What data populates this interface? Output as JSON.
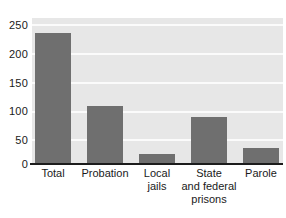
{
  "chart_data": {
    "type": "bar",
    "title": "",
    "subtitle": "",
    "xlabel": "",
    "ylabel": "",
    "categories": [
      "Total",
      "Probation",
      "Local jails",
      "State and federal prisons",
      "Parole"
    ],
    "category_lines": [
      [
        "Total"
      ],
      [
        "Probation"
      ],
      [
        "Local",
        "jails"
      ],
      [
        "State",
        "and federal",
        "prisons"
      ],
      [
        "Parole"
      ]
    ],
    "values": [
      225,
      100,
      17,
      80,
      27
    ],
    "ylim": [
      0,
      250
    ],
    "yticks": [
      0,
      50,
      100,
      150,
      200,
      250
    ],
    "ytick_labels": [
      "0",
      "50",
      "100",
      "150",
      "200",
      "250"
    ],
    "grid": true,
    "grid_axis": "y",
    "legend": "none",
    "colors": {
      "bar_fill": "#6f6f6f",
      "plot_background": "#e7e7e7",
      "gridline": "#fbfbfb",
      "axis_line": "#1c1c1c",
      "text": "#1a1a1a",
      "page_background": "#ffffff"
    }
  }
}
